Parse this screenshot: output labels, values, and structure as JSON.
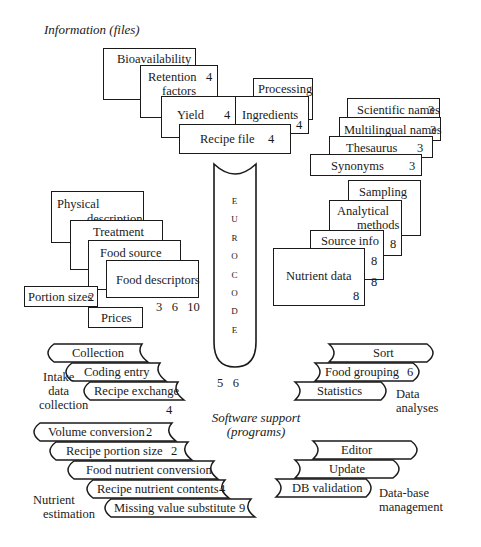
{
  "sections": {
    "information_title": "Information (files)",
    "software_title_line1": "Software support",
    "software_title_line2": "(programs)"
  },
  "recipe_group": {
    "bioavailability": "Bioavailability",
    "retention_line1": "Retention",
    "retention_line2": "factors",
    "retention_num": "4",
    "yield": "Yield",
    "yield_num": "4",
    "processing": "Processing",
    "processing_num": "4",
    "ingredients": "Ingredients",
    "ingredients_num": "4",
    "recipe_file": "Recipe file",
    "recipe_file_num": "4"
  },
  "names_group": {
    "scientific": "Scientific names",
    "scientific_num": "3",
    "multilingual": "Multilingual names",
    "multilingual_num": "3",
    "thesaurus": "Thesaurus",
    "thesaurus_num": "3",
    "synonyms": "Synonyms",
    "synonyms_num": "3"
  },
  "food_group": {
    "physical_line1": "Physical",
    "physical_line2": "description",
    "treatment": "Treatment",
    "food_source": "Food source",
    "food_descriptors": "Food descriptors",
    "portion_sizes": "Portion sizes",
    "portion_sizes_num": "2",
    "refs": "3   6   10",
    "prices": "Prices"
  },
  "nutrient_group": {
    "sampling": "Sampling",
    "analytical_line1": "Analytical",
    "analytical_line2": "methods",
    "analytical_num": "8",
    "source_info": "Source info",
    "source_info_num": "8",
    "nutrient_data": "Nutrient data",
    "nutrient_data_num_side": "8",
    "nutrient_data_num": "8"
  },
  "eurocode": {
    "letters": [
      "E",
      "U",
      "R",
      "O",
      "C",
      "O",
      "D",
      "E"
    ],
    "refs": "5   6"
  },
  "intake": {
    "label_line1": "Intake",
    "label_line2": "data",
    "label_line3": "collection",
    "collection": "Collection",
    "coding_entry": "Coding entry",
    "recipe_exchange": "Recipe exchange",
    "ref": "4"
  },
  "analyses": {
    "label_line1": "Data",
    "label_line2": "analyses",
    "sort": "Sort",
    "food_grouping": "Food grouping",
    "food_grouping_num": "6",
    "statistics": "Statistics"
  },
  "estimation": {
    "label_line1": "Nutrient",
    "label_line2": "estimation",
    "volume_conversion": "Volume conversion",
    "volume_conversion_num": "2",
    "recipe_portion_size": "Recipe portion size",
    "recipe_portion_size_num": "2",
    "food_nutrient_conversion": "Food nutrient conversion",
    "recipe_nutrient_contents": "Recipe nutrient contents",
    "recipe_nutrient_contents_num": "4",
    "missing_value_substitute": "Missing value substitute",
    "missing_value_substitute_num": "9"
  },
  "management": {
    "label_line1": "Data-base",
    "label_line2": "management",
    "editor": "Editor",
    "update": "Update",
    "db_validation": "DB validation"
  }
}
